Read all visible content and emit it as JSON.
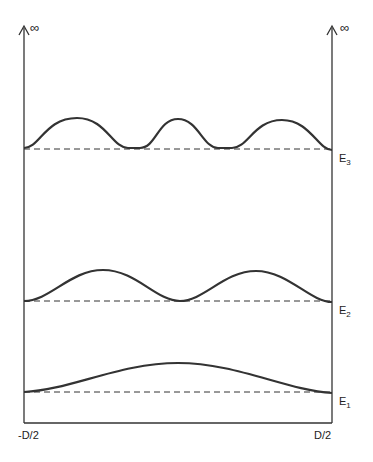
{
  "diagram": {
    "type": "particle-in-a-box energy levels",
    "walls": {
      "left_top": "∞",
      "right_top": "∞"
    },
    "x_axis": {
      "left_label": "-D/2",
      "right_label": "D/2"
    },
    "levels": [
      {
        "name": "E",
        "sub": "3",
        "antinodes": 3
      },
      {
        "name": "E",
        "sub": "2",
        "antinodes": 2
      },
      {
        "name": "E",
        "sub": "1",
        "antinodes": 1
      }
    ],
    "colors": {
      "line": "#333333",
      "background": "#ffffff"
    }
  }
}
